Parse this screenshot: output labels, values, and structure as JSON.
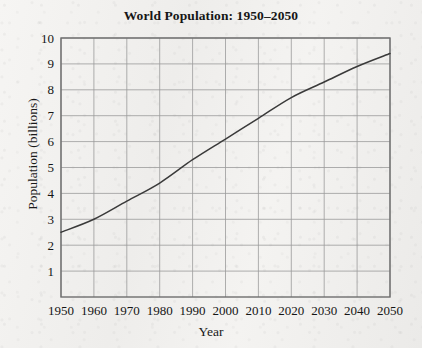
{
  "chart_data": {
    "type": "line",
    "title": "World Population: 1950–2050",
    "xlabel": "Year",
    "ylabel": "Population (billions)",
    "xlim": [
      1950,
      2050
    ],
    "ylim": [
      0,
      10
    ],
    "grid": true,
    "legend": null,
    "x_ticks": [
      1950,
      1960,
      1970,
      1980,
      1990,
      2000,
      2010,
      2020,
      2030,
      2040,
      2050
    ],
    "y_ticks": [
      1,
      2,
      3,
      4,
      5,
      6,
      7,
      8,
      9,
      10
    ],
    "x": [
      1950,
      1960,
      1970,
      1980,
      1990,
      2000,
      2010,
      2020,
      2030,
      2040,
      2050
    ],
    "values": [
      2.5,
      3.0,
      3.7,
      4.4,
      5.3,
      6.1,
      6.9,
      7.7,
      8.3,
      8.9,
      9.4
    ],
    "series": [
      {
        "name": "World population",
        "values": [
          2.5,
          3.0,
          3.7,
          4.4,
          5.3,
          6.1,
          6.9,
          7.7,
          8.3,
          8.9,
          9.4
        ]
      }
    ],
    "line_color": "#3a3a3a",
    "grid_color": "#9a9a9a",
    "axis_color": "#6e6e6e"
  }
}
